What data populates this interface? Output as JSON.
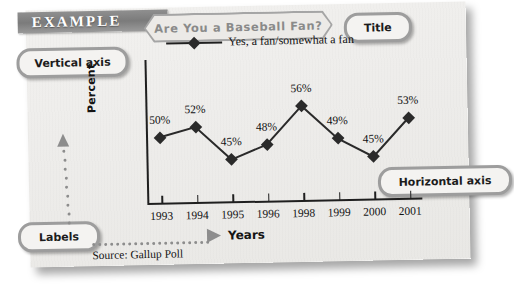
{
  "header": {
    "example_label": "EXAMPLE"
  },
  "callouts": {
    "title": "Title",
    "vertical_axis": "Vertical axis",
    "horizontal_axis": "Horizontal axis",
    "labels": "Labels"
  },
  "chart_data": {
    "type": "line",
    "title": "Are You a Baseball Fan?",
    "xlabel": "Years",
    "ylabel": "Percent",
    "categories": [
      "1993",
      "1994",
      "1995",
      "1996",
      "1998",
      "1999",
      "2000",
      "2001"
    ],
    "values": [
      50,
      52,
      45,
      48,
      56,
      49,
      45,
      53
    ],
    "point_labels": [
      "50%",
      "52%",
      "45%",
      "48%",
      "56%",
      "49%",
      "45%",
      "53%"
    ],
    "series": [
      {
        "name": "Yes, a fan/somewhat a fan",
        "values": [
          50,
          52,
          45,
          48,
          56,
          49,
          45,
          53
        ]
      }
    ],
    "legend": [
      "Yes, a fan/somewhat a fan"
    ],
    "legend_position": "top",
    "ylim": [
      40,
      60
    ],
    "grid": false,
    "marker": "diamond",
    "source": "Source: Gallup Poll",
    "note": "1997 is omitted from the horizontal axis tick labels"
  }
}
